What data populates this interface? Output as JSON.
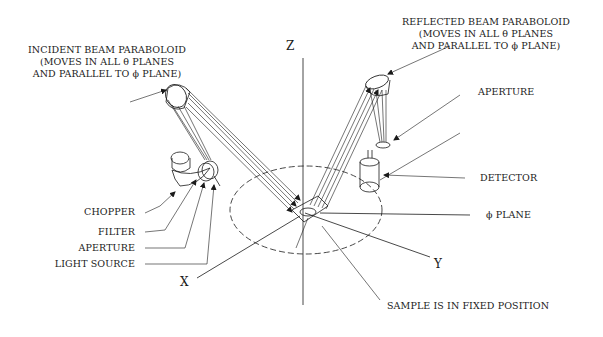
{
  "figure": {
    "type": "optical-schematic"
  },
  "labels": {
    "incident_paraboloid": [
      "INCIDENT BEAM PARABOLOID",
      "(MOVES IN ALL θ PLANES",
      "AND PARALLEL TO ϕ PLANE)"
    ],
    "reflected_paraboloid": [
      "REFLECTED BEAM PARABOLOID",
      "(MOVES IN ALL θ PLANES",
      "AND PARALLEL TO ϕ PLANE)"
    ],
    "aperture_right": "APERTURE",
    "detector": "DETECTOR",
    "phi_plane": "ϕ PLANE",
    "chopper": "CHOPPER",
    "filter": "FILTER",
    "aperture_left": "APERTURE",
    "light_source": "LIGHT SOURCE",
    "sample": "SAMPLE IS IN FIXED POSITION"
  },
  "axes": {
    "z": "Z",
    "x": "X",
    "y": "Y"
  },
  "colors": {
    "ink": "#1a1a1a",
    "background": "#ffffff"
  }
}
